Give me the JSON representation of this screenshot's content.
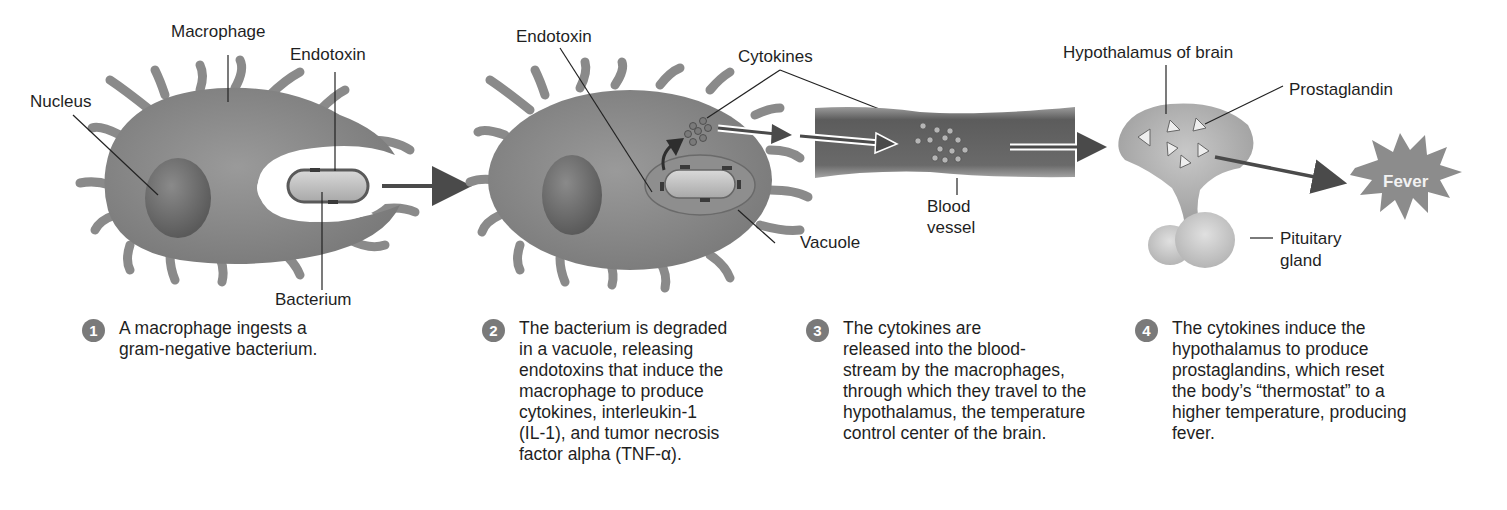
{
  "diagram": {
    "colors": {
      "cell": "#8c8c8c",
      "cell_dark": "#6f6f6f",
      "nucleus": "#666666",
      "vessel": "#6b6b6b",
      "vessel_wall": "#a8a8a8",
      "brain": "#bdbdbd",
      "arrow": "#4a4a4a",
      "fever_burst": "#8a8a8a",
      "step_badge": "#7a7a7a"
    },
    "panel1": {
      "labels": {
        "macrophage": "Macrophage",
        "endotoxin": "Endotoxin",
        "nucleus": "Nucleus",
        "bacterium": "Bacterium"
      }
    },
    "panel2": {
      "labels": {
        "endotoxin": "Endotoxin",
        "cytokines": "Cytokines",
        "vacuole": "Vacuole"
      }
    },
    "panel3": {
      "labels": {
        "blood_vessel": "Blood\nvessel"
      }
    },
    "panel4": {
      "labels": {
        "hypothalamus": "Hypothalamus of brain",
        "prostaglandin": "Prostaglandin",
        "pituitary": "Pituitary\ngland",
        "fever": "Fever"
      }
    },
    "steps": [
      {
        "number": "1",
        "text": "A macrophage ingests a\ngram-negative bacterium."
      },
      {
        "number": "2",
        "text": "The bacterium is degraded\nin a vacuole, releasing\nendotoxins that induce the\nmacrophage to produce\ncytokines, interleukin-1\n(IL-1), and tumor necrosis\nfactor alpha (TNF-α)."
      },
      {
        "number": "3",
        "text": "The cytokines are\nreleased into the blood-\nstream by the macrophages,\nthrough which they travel to the\nhypothalamus, the temperature\ncontrol center of the brain."
      },
      {
        "number": "4",
        "text": "The cytokines induce the\nhypothalamus to produce\nprostaglandins, which reset\nthe body’s “thermostat” to a\nhigher temperature, producing\nfever."
      }
    ]
  }
}
